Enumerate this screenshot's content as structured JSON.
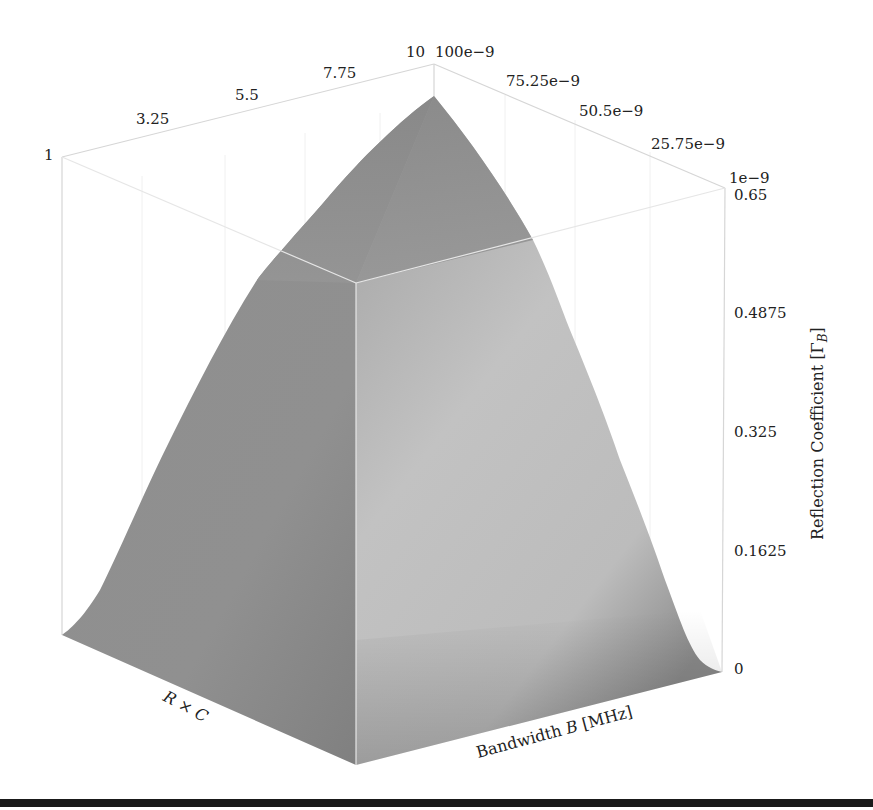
{
  "chart_data": {
    "type": "surface3d",
    "title": "",
    "x_axis": {
      "label": "R × C",
      "label_italic_parts": [
        "R",
        "C"
      ],
      "ticks": [
        "1",
        "3.25",
        "5.5",
        "7.75",
        "10"
      ],
      "range": [
        1,
        10
      ]
    },
    "y_axis": {
      "label": "Bandwidth B [MHz]",
      "ticks": [
        "100e−9",
        "75.25e−9",
        "50.5e−9",
        "25.75e−9",
        "1e−9"
      ],
      "range": [
        1e-09,
        1e-07
      ]
    },
    "z_axis": {
      "label": "Reflection Coefficient [Γ_B]",
      "label_main": "Reflection Coefficient [Γ",
      "label_sub": "B",
      "label_close": "]",
      "ticks": [
        "0",
        "0.1625",
        "0.325",
        "0.4875",
        "0.65"
      ],
      "range": [
        0,
        0.65
      ]
    },
    "surface": {
      "peak": {
        "x": 10,
        "y": 1e-07,
        "z": 0.65
      },
      "min_corner": {
        "x": 1,
        "y": 1e-09,
        "z": 0
      },
      "description": "Reflection coefficient rises monotonically with R×C and bandwidth, reaching ~0.62 at R×C=10, B=100e−9",
      "color_top": "#8a8a8a",
      "color_front_left": "#8c8c8c",
      "color_front_right": "#c8c8c8"
    },
    "grid": true,
    "box": true
  },
  "labels": {
    "x_ticks": [
      "1",
      "3.25",
      "5.5",
      "7.75",
      "10"
    ],
    "y_ticks": [
      "100e−9",
      "75.25e−9",
      "50.5e−9",
      "25.75e−9",
      "1e−9"
    ],
    "z_ticks": [
      "0.65",
      "0.4875",
      "0.325",
      "0.1625",
      "0"
    ],
    "x_label_R": "R",
    "x_label_times": " × ",
    "x_label_C": "C",
    "y_label_pre": "Bandwidth ",
    "y_label_B": "B",
    "y_label_post": " [MHz]",
    "z_label_main": "Reflection Coefficient [Γ",
    "z_label_sub": "B",
    "z_label_close": "]"
  }
}
